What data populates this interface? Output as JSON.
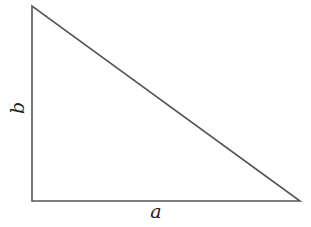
{
  "diagram": {
    "type": "right-triangle",
    "labels": {
      "vertical_leg": "b",
      "horizontal_leg": "a"
    },
    "stroke_color": "#555555"
  }
}
